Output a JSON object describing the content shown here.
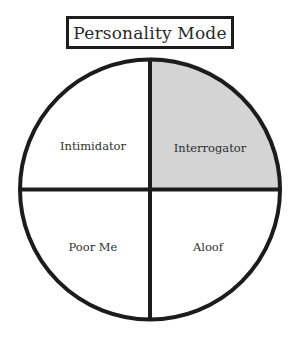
{
  "title": "Personality Mode",
  "colors": {
    "outline": "#1c1c1c",
    "highlight_fill": "#d4d4d4",
    "default_fill": "#ffffff",
    "text": "#2f2f2f"
  },
  "quadrants": [
    {
      "position": "top-left",
      "label": "Intimidator",
      "highlighted": false
    },
    {
      "position": "top-right",
      "label": "Interrogator",
      "highlighted": true
    },
    {
      "position": "bottom-left",
      "label": "Poor Me",
      "highlighted": false
    },
    {
      "position": "bottom-right",
      "label": "Aloof",
      "highlighted": false
    }
  ]
}
